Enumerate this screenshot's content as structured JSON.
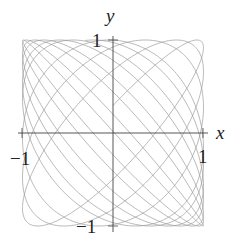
{
  "chart_data": {
    "type": "line",
    "title": "",
    "xlabel": "x",
    "ylabel": "y",
    "xlim": [
      -1,
      1
    ],
    "ylim": [
      -1,
      1
    ],
    "grid": false,
    "legend": null,
    "parametric": {
      "x": "sin(t)",
      "y": "sin(1.07*t + 0.3)",
      "omega": 1.07,
      "phase": 0.3,
      "t_range": [
        0,
        60
      ],
      "samples": 3000
    },
    "ticks": {
      "x": [
        {
          "value": -1,
          "label": "−1"
        },
        {
          "value": 1,
          "label": "1"
        }
      ],
      "y": [
        {
          "value": 1,
          "label": "1"
        },
        {
          "value": -1,
          "label": "−1"
        }
      ]
    },
    "line_color": "#9a9a9a",
    "axis_color": "#444444"
  },
  "labels": {
    "x_axis": "x",
    "y_axis": "y",
    "x_tick_neg": "−1",
    "x_tick_pos": "1",
    "y_tick_pos": "1",
    "y_tick_neg": "−1"
  }
}
